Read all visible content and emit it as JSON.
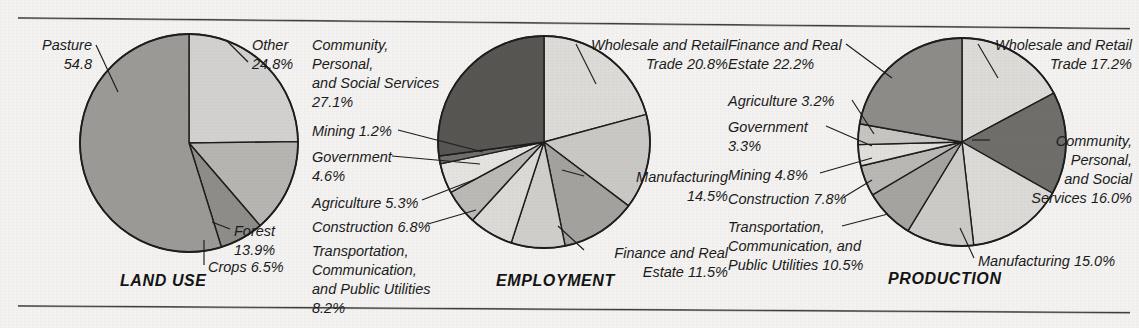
{
  "figure": {
    "background_color": "#f3f2f0",
    "rule_color": "#3a3a3a",
    "outline_color": "#1d1d1d"
  },
  "chart_data": [
    {
      "type": "pie",
      "title": "LAND USE",
      "start_angle_deg": 0,
      "direction": "clockwise",
      "categories": [
        "Other",
        "Forest",
        "Crops",
        "Pasture"
      ],
      "values": [
        24.8,
        13.9,
        6.5,
        54.8
      ],
      "labels": [
        "Other\n24.8%",
        "Forest\n13.9%",
        "Crops 6.5%",
        "Pasture\n54.8"
      ],
      "colors": [
        "#d2d1cf",
        "#b6b5b2",
        "#8e8d8a",
        "#9b9a97"
      ],
      "legend": "none",
      "grid": false
    },
    {
      "type": "pie",
      "title": "EMPLOYMENT",
      "start_angle_deg": 0,
      "direction": "clockwise",
      "categories": [
        "Wholesale and Retail Trade",
        "Manufacturing",
        "Finance and Real Estate",
        "Transportation, Communication, and Public Utilities",
        "Construction",
        "Agriculture",
        "Government",
        "Mining",
        "Community, Personal, and Social Services"
      ],
      "values": [
        20.8,
        14.5,
        11.5,
        8.2,
        6.8,
        5.3,
        4.6,
        1.2,
        27.1
      ],
      "labels": [
        "Wholesale and Retail\nTrade 20.8%",
        "Manufacturing\n14.5%",
        "Finance and Real\nEstate 11.5%",
        "Transportation, Communication,\nand Public Utilities\n8.2%",
        "Construction 6.8%",
        "Agriculture 5.3%",
        "Government\n4.6%",
        "Mining 1.2%",
        "Community, Personal,\nand Social Services\n27.1%"
      ],
      "colors": [
        "#dcdbd8",
        "#c9c8c5",
        "#a3a29f",
        "#cfcecb",
        "#dbdad7",
        "#bab9b6",
        "#e4e3e0",
        "#6f6e6b",
        "#575653"
      ],
      "legend": "none",
      "grid": false
    },
    {
      "type": "pie",
      "title": "PRODUCTION",
      "start_angle_deg": 0,
      "direction": "clockwise",
      "categories": [
        "Wholesale and Retail Trade",
        "Community, Personal, and Social Services",
        "Manufacturing",
        "Transportation, Communication, and Public Utilities",
        "Construction",
        "Mining",
        "Government",
        "Agriculture",
        "Finance and Real Estate"
      ],
      "values": [
        17.2,
        16.0,
        15.0,
        10.5,
        7.8,
        4.8,
        3.3,
        3.2,
        22.2
      ],
      "labels": [
        "Wholesale and Retail\nTrade 17.2%",
        "Community,\nPersonal,\nand Social\nServices 16.0%",
        "Manufacturing 15.0%",
        "Transportation,\nCommunication, and\nPublic Utilities 10.5%",
        "Construction 7.8%",
        "Mining 4.8%",
        "Government\n3.3%",
        "Agriculture 3.2%",
        "Finance and Real\nEstate 22.2%"
      ],
      "colors": [
        "#dcdbd8",
        "#6f6e6b",
        "#dbdad7",
        "#cbcac7",
        "#a5a4a1",
        "#b9b8b5",
        "#e0dfdc",
        "#c6c5c2",
        "#8d8c89"
      ],
      "legend": "none",
      "grid": false
    }
  ],
  "land_use": {
    "title": "LAND USE",
    "label_pasture": "Pasture\n54.8",
    "label_other": "Other\n24.8%",
    "label_forest": "Forest\n13.9%",
    "label_crops": "Crops 6.5%"
  },
  "employment": {
    "title": "EMPLOYMENT",
    "label_community": "Community, Personal,\nand Social Services\n27.1%",
    "label_mining": "Mining 1.2%",
    "label_government": "Government\n4.6%",
    "label_agriculture": "Agriculture 5.3%",
    "label_construction": "Construction 6.8%",
    "label_transportation": "Transportation, Communication,\nand Public Utilities\n8.2%",
    "label_wholesale": "Wholesale and Retail\nTrade 20.8%",
    "label_manufacturing": "Manufacturing\n14.5%",
    "label_finance": "Finance and Real\nEstate 11.5%"
  },
  "production": {
    "title": "PRODUCTION",
    "label_finance": "Finance and Real\nEstate 22.2%",
    "label_agriculture": "Agriculture 3.2%",
    "label_government": "Government\n3.3%",
    "label_mining": "Mining 4.8%",
    "label_construction": "Construction 7.8%",
    "label_transportation": "Transportation,\nCommunication, and\nPublic Utilities 10.5%",
    "label_wholesale": "Wholesale and Retail\nTrade 17.2%",
    "label_community": "Community,\nPersonal,\nand Social\nServices 16.0%",
    "label_manufacturing": "Manufacturing 15.0%"
  }
}
